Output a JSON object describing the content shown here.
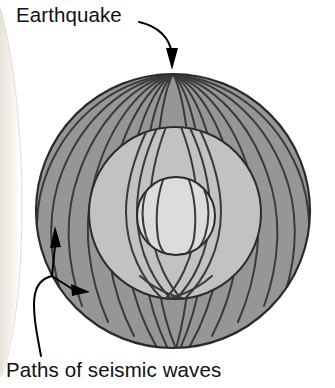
{
  "figure": {
    "title_visible": false,
    "type": "cross-section diagram",
    "labels": {
      "earthquake": "Earthquake",
      "paths": "Paths of seismic waves"
    },
    "colors": {
      "page_background": "#ffffff",
      "mantle_fill": "#969696",
      "outer_core_fill": "#c2c2c2",
      "inner_core_fill": "#dcdcdc",
      "ray_stroke": "#3a3a3a",
      "boundary_stroke": "#2b2b2b",
      "label_text": "#111111",
      "arrow_color": "#000000",
      "scan_shadow": "#f0ece6"
    },
    "geometry": {
      "earth_center_x": 173,
      "earth_center_y": 211,
      "earth_radius": 137,
      "outer_core_center_x": 175,
      "outer_core_center_y": 213,
      "outer_core_radius": 86,
      "inner_core_center_x": 176,
      "inner_core_center_y": 216,
      "inner_core_radius": 39,
      "focus_x": 173,
      "focus_y": 74
    },
    "layers": [
      {
        "name": "mantle",
        "fill": "#969696"
      },
      {
        "name": "outer-core",
        "fill": "#c2c2c2"
      },
      {
        "name": "inner-core",
        "fill": "#dcdcdc"
      }
    ],
    "annotations": [
      {
        "name": "earthquake-pointer",
        "text": "Earthquake",
        "arrow": "curved-down-right",
        "target_x": 173,
        "target_y": 70
      },
      {
        "name": "paths-pointer",
        "text": "Paths of seismic waves",
        "arrow": "forked-up-and-right",
        "target_a_x": 55,
        "target_a_y": 238,
        "target_b_x": 85,
        "target_b_y": 300
      }
    ]
  }
}
